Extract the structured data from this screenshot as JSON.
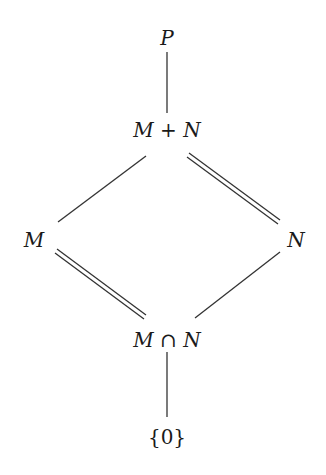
{
  "diagram": {
    "type": "lattice",
    "nodes": {
      "top": {
        "label": "P",
        "x": 167,
        "y": 38
      },
      "sum": {
        "label_left": "M",
        "operator": " + ",
        "label_right": "N",
        "x": 167,
        "y": 130
      },
      "left": {
        "label": "M",
        "x": 34,
        "y": 240
      },
      "right": {
        "label": "N",
        "x": 296,
        "y": 240
      },
      "intersection": {
        "label_left": "M",
        "operator": " ∩ ",
        "label_right": "N",
        "x": 167,
        "y": 340
      },
      "bottom": {
        "label": "{0}",
        "x": 167,
        "y": 437
      }
    },
    "edges": [
      {
        "from": "top",
        "to": "sum",
        "style": "single"
      },
      {
        "from": "sum",
        "to": "left",
        "style": "single"
      },
      {
        "from": "sum",
        "to": "right",
        "style": "double"
      },
      {
        "from": "left",
        "to": "intersection",
        "style": "double"
      },
      {
        "from": "right",
        "to": "intersection",
        "style": "single"
      },
      {
        "from": "intersection",
        "to": "bottom",
        "style": "single"
      }
    ],
    "colors": {
      "line": "#333333",
      "text": "#1a1a1a",
      "background": "#ffffff"
    }
  }
}
